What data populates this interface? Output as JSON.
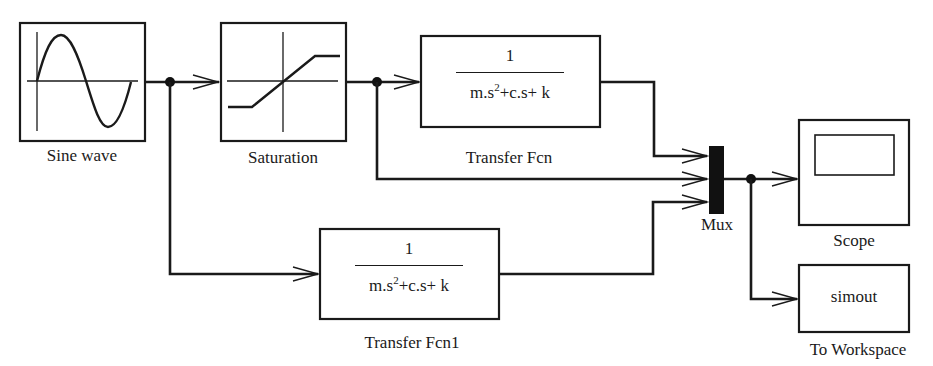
{
  "diagram": {
    "type": "simulink-block-diagram",
    "blocks": [
      {
        "id": "sine",
        "label": "Sine wave",
        "icon": "sine-wave-icon"
      },
      {
        "id": "saturation",
        "label": "Saturation",
        "icon": "saturation-icon"
      },
      {
        "id": "tf1",
        "label": "Transfer Fcn",
        "numerator": "1",
        "denominator_a": "m.s",
        "denominator_exp": "2",
        "denominator_b": "+c.s+ k"
      },
      {
        "id": "tf2",
        "label": "Transfer Fcn1",
        "numerator": "1",
        "denominator_a": "m.s",
        "denominator_exp": "2",
        "denominator_b": "+c.s+ k"
      },
      {
        "id": "mux",
        "label": "Mux"
      },
      {
        "id": "scope",
        "label": "Scope",
        "icon": "scope-icon"
      },
      {
        "id": "workspace",
        "label": "To Workspace",
        "variable": "simout"
      }
    ],
    "connections": [
      {
        "from": "Sine wave",
        "to": "Saturation"
      },
      {
        "from": "Sine wave",
        "to": "Transfer Fcn1"
      },
      {
        "from": "Saturation",
        "to": "Transfer Fcn"
      },
      {
        "from": "Saturation",
        "to": "Mux (input 2)"
      },
      {
        "from": "Transfer Fcn",
        "to": "Mux (input 1)"
      },
      {
        "from": "Transfer Fcn1",
        "to": "Mux (input 3)"
      },
      {
        "from": "Mux",
        "to": "Scope"
      },
      {
        "from": "Mux",
        "to": "To Workspace"
      }
    ]
  }
}
